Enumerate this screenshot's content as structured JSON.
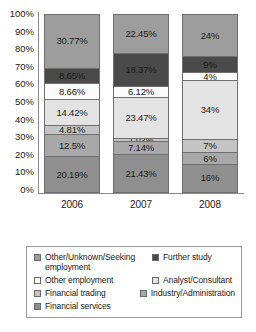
{
  "chart_data": {
    "type": "bar",
    "subtype": "100% stacked bar",
    "title": "",
    "xlabel": "",
    "ylabel": "",
    "categories": [
      "2006",
      "2007",
      "2008"
    ],
    "ylim": [
      0,
      100
    ],
    "ytick_labels": [
      "100%",
      "90%",
      "80%",
      "70%",
      "60%",
      "50%",
      "40%",
      "30%",
      "20%",
      "10%",
      "0%"
    ],
    "ytick_values": [
      100,
      90,
      80,
      70,
      60,
      50,
      40,
      30,
      20,
      10,
      0
    ],
    "grid": false,
    "legend_position": "bottom",
    "stack_order_bottom_to_top": [
      "Financial services",
      "Industry/Administration",
      "Financial trading",
      "Analyst/Consultant",
      "Other employment",
      "Further study",
      "Other/Unknown/Seeking employment"
    ],
    "series": [
      {
        "name": "Financial services",
        "color": "#8f8f8f",
        "values": [
          20.19,
          21.43,
          16
        ],
        "labels": [
          "20.19%",
          "21.43%",
          "16%"
        ]
      },
      {
        "name": "Industry/Administration",
        "color": "#a8a8a8",
        "values": [
          12.5,
          7.14,
          6
        ],
        "labels": [
          "12.5%",
          "7.14%",
          "6%"
        ]
      },
      {
        "name": "Financial trading",
        "color": "#c4c4c4",
        "values": [
          4.81,
          1.02,
          7
        ],
        "labels": [
          "4.81%",
          "1.02%",
          "7%"
        ]
      },
      {
        "name": "Analyst/Consultant",
        "color": "#e3e3e3",
        "values": [
          14.42,
          23.47,
          34
        ],
        "labels": [
          "14.42%",
          "23.47%",
          "34%"
        ]
      },
      {
        "name": "Other employment",
        "color": "#fbfbfb",
        "values": [
          8.66,
          6.12,
          4
        ],
        "labels": [
          "8.66%",
          "6.12%",
          "4%"
        ]
      },
      {
        "name": "Further study",
        "color": "#4a4a4a",
        "values": [
          8.65,
          18.37,
          9
        ],
        "labels": [
          "8.65%",
          "18.37%",
          "9%"
        ]
      },
      {
        "name": "Other/Unknown/Seeking employment",
        "color": "#9d9d9d",
        "values": [
          30.77,
          22.45,
          24
        ],
        "labels": [
          "30.77%",
          "22.45%",
          "24%"
        ]
      }
    ]
  },
  "legend": {
    "rows": [
      [
        {
          "label": "Other/Unknown/Seeking employment",
          "color": "#9d9d9d"
        },
        {
          "label": "Further study",
          "color": "#4a4a4a"
        }
      ],
      [
        {
          "label": "Other employment",
          "color": "#fbfbfb"
        },
        {
          "label": "Analyst/Consultant",
          "color": "#e3e3e3"
        }
      ],
      [
        {
          "label": "Financial trading",
          "color": "#c4c4c4"
        },
        {
          "label": "Industry/Administration",
          "color": "#a8a8a8"
        }
      ],
      [
        {
          "label": "Financial services",
          "color": "#8f8f8f"
        }
      ]
    ]
  }
}
